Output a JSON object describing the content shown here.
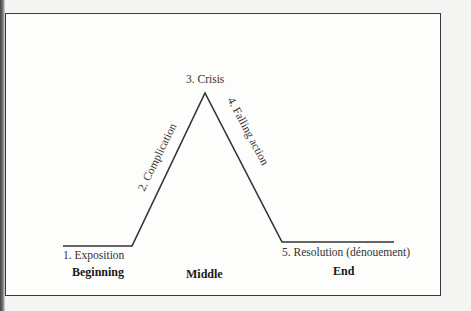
{
  "diagram": {
    "title": "",
    "stages": [
      {
        "label": "1. Exposition"
      },
      {
        "label": "2. Complication"
      },
      {
        "label": "3. Crisis"
      },
      {
        "label": "4. Falling action"
      },
      {
        "label": "5. Resolution (dénouement)"
      }
    ],
    "phases": [
      {
        "label": "Beginning"
      },
      {
        "label": "Middle"
      },
      {
        "label": "End"
      }
    ],
    "line_color": "#333333",
    "points": [
      [
        63,
        246
      ],
      [
        132,
        246
      ],
      [
        205,
        93
      ],
      [
        282,
        242
      ],
      [
        394,
        242
      ]
    ]
  }
}
